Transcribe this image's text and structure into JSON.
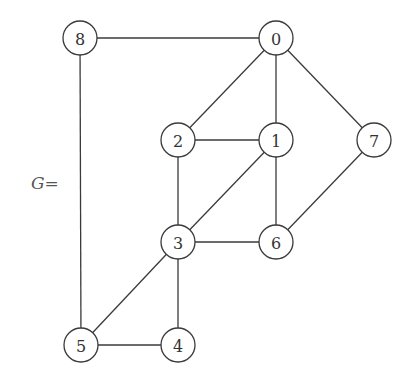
{
  "graph": {
    "label_var": "G",
    "label_eq": "=",
    "nodes": [
      {
        "id": "0",
        "x": 276,
        "y": 38
      },
      {
        "id": "1",
        "x": 276,
        "y": 140
      },
      {
        "id": "2",
        "x": 178,
        "y": 140
      },
      {
        "id": "3",
        "x": 178,
        "y": 242
      },
      {
        "id": "4",
        "x": 178,
        "y": 345
      },
      {
        "id": "5",
        "x": 81,
        "y": 345
      },
      {
        "id": "6",
        "x": 276,
        "y": 242
      },
      {
        "id": "7",
        "x": 374,
        "y": 140
      },
      {
        "id": "8",
        "x": 80,
        "y": 38
      }
    ],
    "edges": [
      [
        "8",
        "0"
      ],
      [
        "8",
        "5"
      ],
      [
        "0",
        "2"
      ],
      [
        "0",
        "1"
      ],
      [
        "0",
        "7"
      ],
      [
        "2",
        "1"
      ],
      [
        "2",
        "3"
      ],
      [
        "1",
        "3"
      ],
      [
        "1",
        "6"
      ],
      [
        "7",
        "6"
      ],
      [
        "3",
        "6"
      ],
      [
        "3",
        "5"
      ],
      [
        "3",
        "4"
      ],
      [
        "5",
        "4"
      ]
    ],
    "node_radius": 17
  }
}
